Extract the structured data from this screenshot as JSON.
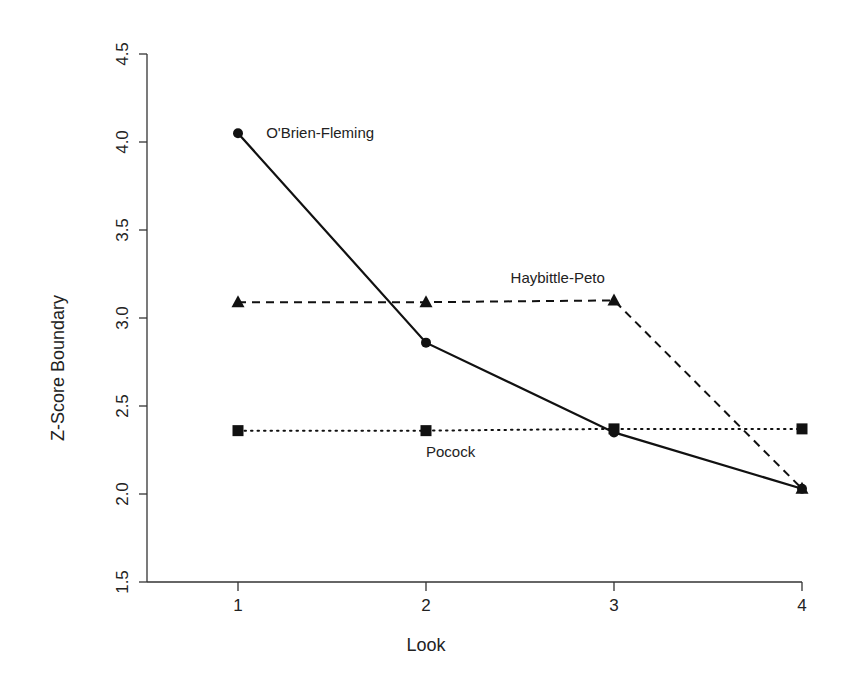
{
  "chart_data": {
    "type": "line",
    "title": "",
    "xlabel": "Look",
    "ylabel": "Z-Score Boundary",
    "x": [
      1,
      2,
      3,
      4
    ],
    "xticks": [
      "1",
      "2",
      "3",
      "4"
    ],
    "yticks": [
      "1.5",
      "2.0",
      "2.5",
      "3.0",
      "3.5",
      "4.0",
      "4.5"
    ],
    "ylim": [
      1.5,
      4.5
    ],
    "xlim": [
      0.5,
      4
    ],
    "grid": false,
    "legend": "none (series labelled inline)",
    "series": [
      {
        "name": "O'Brien-Fleming",
        "values": [
          4.05,
          2.86,
          2.35,
          2.03
        ],
        "line": "solid",
        "marker": "circle"
      },
      {
        "name": "Haybittle-Peto",
        "values": [
          3.09,
          3.09,
          3.1,
          2.03
        ],
        "line": "dashed",
        "marker": "triangle"
      },
      {
        "name": "Pocock",
        "values": [
          2.36,
          2.36,
          2.37,
          2.37
        ],
        "line": "dotted",
        "marker": "square"
      }
    ],
    "annotations": [
      {
        "text": "O'Brien-Fleming",
        "x": 1.15,
        "y": 4.05
      },
      {
        "text": "Haybittle-Peto",
        "x": 2.45,
        "y": 3.23
      },
      {
        "text": "Pocock",
        "x": 2.0,
        "y": 2.24
      }
    ]
  }
}
